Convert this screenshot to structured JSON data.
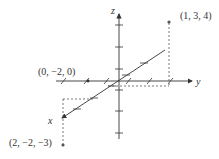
{
  "diagram": {
    "axes": {
      "x_label": "x",
      "y_label": "y",
      "z_label": "z"
    },
    "points": [
      {
        "label": "(1, 3, 4)",
        "coords": [
          1,
          3,
          4
        ]
      },
      {
        "label": "(0, −2, 0)",
        "coords": [
          0,
          -2,
          0
        ]
      },
      {
        "label": "(2, −2, −3)",
        "coords": [
          2,
          -2,
          -3
        ]
      }
    ],
    "colors": {
      "axis": "#333333",
      "dashed": "#555555",
      "point": "#555555"
    }
  }
}
